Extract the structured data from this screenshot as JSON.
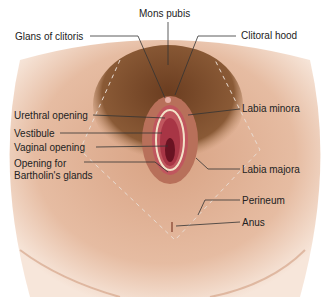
{
  "diagram": {
    "labels": {
      "mons_pubis": "Mons pubis",
      "glans_of_clitoris": "Glans of clitoris",
      "clitoral_hood": "Clitoral hood",
      "urethral_opening": "Urethral opening",
      "vestibule": "Vestibule",
      "vaginal_opening": "Vaginal opening",
      "opening_for_bartholins_1": "Opening for",
      "opening_for_bartholins_2": "Bartholin's glands",
      "labia_minora": "Labia minora",
      "labia_majora": "Labia majora",
      "perineum": "Perineum",
      "anus": "Anus"
    },
    "colors": {
      "skin": "#d9a98a",
      "skin_light": "#f0d5c2",
      "hair": "#7a4a2a",
      "tissue": "#c0565e",
      "inner": "#8a1f2e",
      "leader": "#333333"
    }
  }
}
